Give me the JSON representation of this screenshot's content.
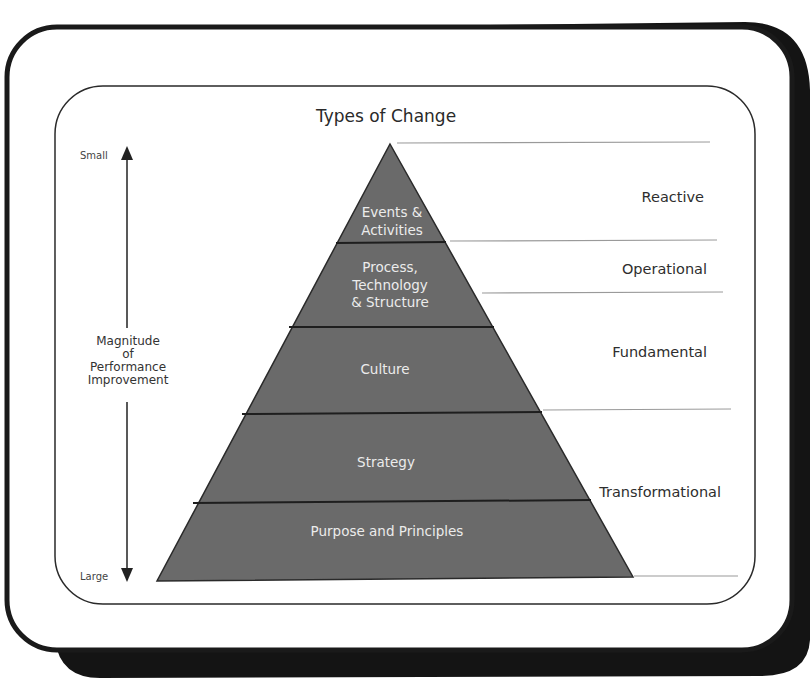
{
  "diagram": {
    "title": "Types of Change",
    "axis": {
      "top_label": "Small",
      "bottom_label": "Large",
      "middle_label_lines": [
        "Magnitude",
        "of",
        "Performance",
        "Improvement"
      ]
    },
    "pyramid_levels": [
      {
        "lines": [
          "Events &",
          "Activities"
        ]
      },
      {
        "lines": [
          "Process,",
          "Technology",
          "& Structure"
        ]
      },
      {
        "lines": [
          "Culture"
        ]
      },
      {
        "lines": [
          "Strategy"
        ]
      },
      {
        "lines": [
          "Purpose and Principles"
        ]
      }
    ],
    "change_types": [
      {
        "label": "Reactive"
      },
      {
        "label": "Operational"
      },
      {
        "label": "Fundamental"
      },
      {
        "label": "Transformational"
      }
    ],
    "colors": {
      "pyramid_fill": "#6a6a6a",
      "pyramid_text": "#ececec",
      "frame": "#1a1a1a",
      "divider_lines": "#9a9a9a",
      "text": "#2e2e2e"
    }
  }
}
